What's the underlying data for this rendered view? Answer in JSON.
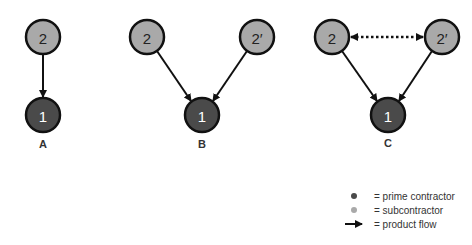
{
  "colors": {
    "prime": "#4a4a4a",
    "sub": "#a9a9a9",
    "stroke": "#111111",
    "prime_text": "#ffffff",
    "sub_text": "#222222"
  },
  "diagrams": [
    {
      "label": "A",
      "nodes": [
        {
          "text": "2",
          "type": "sub"
        },
        {
          "text": "1",
          "type": "prime"
        }
      ]
    },
    {
      "label": "B",
      "nodes": [
        {
          "text": "2",
          "type": "sub"
        },
        {
          "text": "2′",
          "type": "sub"
        },
        {
          "text": "1",
          "type": "prime"
        }
      ]
    },
    {
      "label": "C",
      "nodes": [
        {
          "text": "2",
          "type": "sub"
        },
        {
          "text": "2′",
          "type": "sub"
        },
        {
          "text": "1",
          "type": "prime"
        }
      ]
    }
  ],
  "legend": {
    "items": [
      {
        "symbol": "dark-dot",
        "text": "= prime contractor"
      },
      {
        "symbol": "light-dot",
        "text": "= subcontractor"
      },
      {
        "symbol": "arrow",
        "text": "= product flow"
      }
    ]
  }
}
